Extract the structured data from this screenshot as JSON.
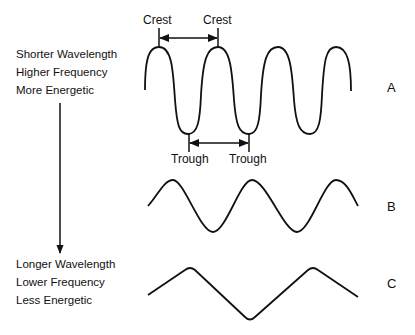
{
  "top_description": {
    "lines": [
      "Shorter Wavelength",
      "Higher Frequency",
      "More Energetic"
    ]
  },
  "bottom_description": {
    "lines": [
      "Longer Wavelength",
      "Lower Frequency",
      "Less Energetic"
    ]
  },
  "annotations": {
    "crest_left": "Crest",
    "crest_right": "Crest",
    "trough_left": "Trough",
    "trough_right": "Trough"
  },
  "waves": [
    {
      "id": "A",
      "label": "A",
      "description": "short wavelength, high frequency"
    },
    {
      "id": "B",
      "label": "B",
      "description": "medium wavelength"
    },
    {
      "id": "C",
      "label": "C",
      "description": "long wavelength, low frequency"
    }
  ],
  "colors": {
    "stroke": "#111111",
    "background": "#ffffff"
  }
}
